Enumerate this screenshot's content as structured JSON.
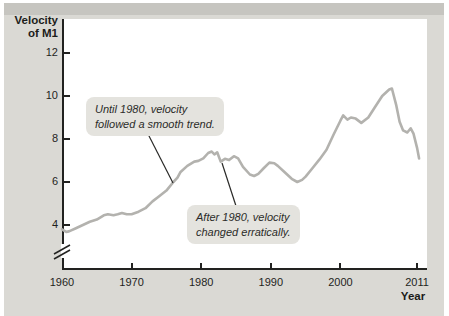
{
  "figure": {
    "y_axis_title_line1": "Velocity",
    "y_axis_title_line2": "of M1",
    "x_axis_title": "Year"
  },
  "colors": {
    "panel_background": "#dad9d4",
    "panel_top_edge": "#c6c5c0",
    "plot_background": "#ffffff",
    "axis": "#222220",
    "curve": "#b3b2ae",
    "annotation_bubble": "#e4e3de",
    "annotation_text": "#2b2b29",
    "leader_line": "#2a2a28"
  },
  "chart_data": {
    "type": "line",
    "title": "",
    "xlabel": "Year",
    "ylabel": "Velocity of M1",
    "x_ticks": [
      1960,
      1970,
      1980,
      1990,
      2000,
      2011
    ],
    "y_ticks": [
      4,
      6,
      8,
      10,
      12
    ],
    "xlim": [
      1960,
      2012.4
    ],
    "ylim": [
      3.4,
      12.7
    ],
    "y_axis_break": true,
    "grid": false,
    "legend": "none",
    "series": [
      {
        "name": "Velocity of M1",
        "points": [
          [
            1960,
            3.8
          ],
          [
            1960.6,
            3.68
          ],
          [
            1961,
            3.7
          ],
          [
            1962,
            3.85
          ],
          [
            1963,
            4.0
          ],
          [
            1964,
            4.15
          ],
          [
            1965,
            4.25
          ],
          [
            1966,
            4.45
          ],
          [
            1966.6,
            4.5
          ],
          [
            1967.4,
            4.45
          ],
          [
            1968,
            4.5
          ],
          [
            1968.6,
            4.56
          ],
          [
            1969.3,
            4.5
          ],
          [
            1970,
            4.5
          ],
          [
            1971,
            4.62
          ],
          [
            1972,
            4.78
          ],
          [
            1973,
            5.1
          ],
          [
            1974,
            5.35
          ],
          [
            1975,
            5.6
          ],
          [
            1976,
            6.0
          ],
          [
            1976.6,
            6.2
          ],
          [
            1977,
            6.45
          ],
          [
            1978,
            6.75
          ],
          [
            1979,
            6.95
          ],
          [
            1979.6,
            6.98
          ],
          [
            1980.3,
            7.1
          ],
          [
            1981,
            7.35
          ],
          [
            1981.5,
            7.42
          ],
          [
            1981.9,
            7.28
          ],
          [
            1982.3,
            7.38
          ],
          [
            1982.8,
            6.95
          ],
          [
            1983.4,
            7.08
          ],
          [
            1984,
            7.02
          ],
          [
            1984.7,
            7.2
          ],
          [
            1985.3,
            7.1
          ],
          [
            1986,
            6.7
          ],
          [
            1987,
            6.35
          ],
          [
            1987.6,
            6.28
          ],
          [
            1988.2,
            6.38
          ],
          [
            1989,
            6.65
          ],
          [
            1989.8,
            6.9
          ],
          [
            1990.5,
            6.87
          ],
          [
            1991,
            6.75
          ],
          [
            1992,
            6.45
          ],
          [
            1993,
            6.15
          ],
          [
            1993.8,
            6.0
          ],
          [
            1994.5,
            6.1
          ],
          [
            1995,
            6.25
          ],
          [
            1996,
            6.65
          ],
          [
            1997,
            7.05
          ],
          [
            1998,
            7.5
          ],
          [
            1999,
            8.2
          ],
          [
            2000,
            8.85
          ],
          [
            2000.4,
            9.1
          ],
          [
            2001,
            8.9
          ],
          [
            2001.5,
            9.0
          ],
          [
            2002.2,
            8.95
          ],
          [
            2003,
            8.75
          ],
          [
            2004,
            9.0
          ],
          [
            2005,
            9.5
          ],
          [
            2006,
            10.0
          ],
          [
            2007,
            10.3
          ],
          [
            2007.4,
            10.35
          ],
          [
            2008,
            9.6
          ],
          [
            2008.5,
            8.8
          ],
          [
            2009,
            8.4
          ],
          [
            2009.6,
            8.3
          ],
          [
            2010.1,
            8.5
          ],
          [
            2010.5,
            8.25
          ],
          [
            2011,
            7.6
          ],
          [
            2011.3,
            7.1
          ]
        ]
      }
    ],
    "annotations": [
      {
        "line1": "Until 1980, velocity",
        "line2": "followed a smooth trend.",
        "anchor_year": 1976,
        "anchor_value": 6.0
      },
      {
        "line1": "After 1980, velocity",
        "line2": "changed erratically.",
        "anchor_year": 1983,
        "anchor_value": 6.9
      }
    ]
  }
}
